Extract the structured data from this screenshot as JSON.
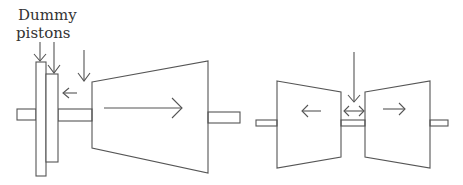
{
  "labels": {
    "line1": "Dummy",
    "line2": "pistons"
  },
  "colors": {
    "stroke": "#555555",
    "text": "#333333",
    "background": "#ffffff"
  },
  "diagrams": [
    {
      "name": "single-flow-turbine-with-dummy-pistons",
      "flow_direction": "right",
      "thrust_balance": "dummy pistons (left arrow)"
    },
    {
      "name": "double-flow-turbine",
      "flow_directions": [
        "left",
        "right"
      ],
      "steam_inlet": "center"
    }
  ]
}
